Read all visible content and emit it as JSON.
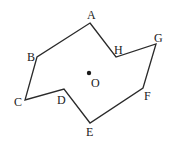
{
  "diagram": {
    "type": "polygon",
    "stroke_color": "#2a2a2a",
    "label_color": "#222222",
    "vertices": [
      {
        "name": "A",
        "x": 90,
        "y": 23,
        "label_x": 87,
        "label_y": 19
      },
      {
        "name": "H",
        "x": 116,
        "y": 57,
        "label_x": 114,
        "label_y": 54
      },
      {
        "name": "G",
        "x": 156,
        "y": 44,
        "label_x": 154,
        "label_y": 42
      },
      {
        "name": "F",
        "x": 143,
        "y": 88,
        "label_x": 144,
        "label_y": 100
      },
      {
        "name": "E",
        "x": 90,
        "y": 123,
        "label_x": 86,
        "label_y": 136
      },
      {
        "name": "D",
        "x": 64,
        "y": 89,
        "label_x": 57,
        "label_y": 104
      },
      {
        "name": "C",
        "x": 25,
        "y": 100,
        "label_x": 14,
        "label_y": 106
      },
      {
        "name": "B",
        "x": 37,
        "y": 57,
        "label_x": 27,
        "label_y": 61
      }
    ],
    "center": {
      "name": "O",
      "x": 89,
      "y": 73,
      "label_x": 91,
      "label_y": 87
    }
  }
}
